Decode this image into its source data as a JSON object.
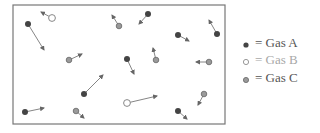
{
  "diagram": {
    "box": {
      "x": 13,
      "y": 5,
      "width": 212,
      "height": 119
    },
    "colors": {
      "gas_a_fill": "#444444",
      "gas_b_stroke": "#888888",
      "gas_c_fill": "#9a9a9a",
      "gas_c_stroke": "#666666",
      "arrow": "#777777",
      "box_stroke": "#777777"
    },
    "particles": [
      {
        "type": "A",
        "x": 28,
        "y": 24,
        "ax": 44,
        "ay": 50
      },
      {
        "type": "B",
        "x": 52,
        "y": 18,
        "ax": 41,
        "ay": 12
      },
      {
        "type": "C",
        "x": 119,
        "y": 26,
        "ax": 112,
        "ay": 15
      },
      {
        "type": "A",
        "x": 148,
        "y": 14,
        "ax": 139,
        "ay": 24
      },
      {
        "type": "C",
        "x": 69,
        "y": 60,
        "ax": 82,
        "ay": 54
      },
      {
        "type": "A",
        "x": 127,
        "y": 59,
        "ax": 134,
        "ay": 74
      },
      {
        "type": "C",
        "x": 156,
        "y": 60,
        "ax": 153,
        "ay": 48
      },
      {
        "type": "A",
        "x": 178,
        "y": 35,
        "ax": 189,
        "ay": 41
      },
      {
        "type": "A",
        "x": 217,
        "y": 34,
        "ax": 209,
        "ay": 20
      },
      {
        "type": "C",
        "x": 209,
        "y": 62,
        "ax": 196,
        "ay": 62
      },
      {
        "type": "A",
        "x": 25,
        "y": 112,
        "ax": 44,
        "ay": 108
      },
      {
        "type": "A",
        "x": 84,
        "y": 94,
        "ax": 103,
        "ay": 75
      },
      {
        "type": "C",
        "x": 76,
        "y": 111,
        "ax": 84,
        "ay": 118
      },
      {
        "type": "B",
        "x": 127,
        "y": 103,
        "ax": 157,
        "ay": 96
      },
      {
        "type": "A",
        "x": 178,
        "y": 111,
        "ax": 187,
        "ay": 119
      },
      {
        "type": "C",
        "x": 204,
        "y": 94,
        "ax": 198,
        "ay": 105
      }
    ]
  },
  "legend": {
    "items": [
      {
        "symbol": "filled-dark-dot",
        "label": "= Gas A"
      },
      {
        "symbol": "hollow-dot",
        "label": "= Gas B"
      },
      {
        "symbol": "gray-dot",
        "label": "= Gas C"
      }
    ]
  }
}
